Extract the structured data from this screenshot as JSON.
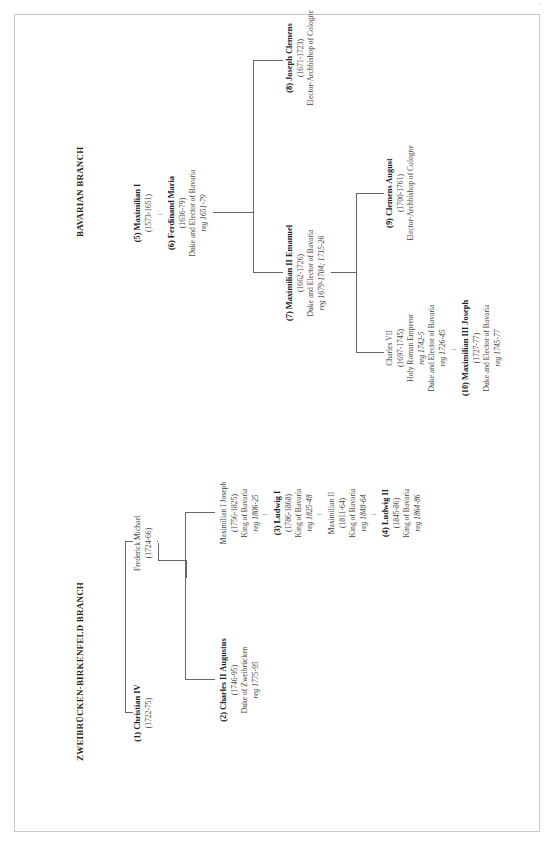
{
  "zweibrucken": {
    "title": "ZWEIBRÜCKEN-BIRKENFELD BRANCH",
    "christian_iv": {
      "name": "(1) Christian IV",
      "dates": "(1722-75)"
    },
    "frederick_michael": {
      "name": "Frederick Michael",
      "dates": "(1724-66)"
    },
    "charles_ii_augustus": {
      "name": "(2) Charles II Augustus",
      "dates": "(1746-95)",
      "title": "Duke of Zweibrücken",
      "reign": "reg 1775-95"
    },
    "maximilian_i_joseph": {
      "name": "Maximilian I Joseph",
      "dates": "(1756-1825)",
      "title": "King of Bavaria",
      "reign": "reg 1806-25"
    },
    "ludwig_i": {
      "name": "(3) Ludwig I",
      "dates": "(1786-1868)",
      "title": "King of Bavaria",
      "reign": "reg 1825-48"
    },
    "maximilian_ii": {
      "name": "Maximilian II",
      "dates": "(1811-64)",
      "title": "King of Bavaria",
      "reign": "reg 1848-64"
    },
    "ludwig_ii": {
      "name": "(4) Ludwig II",
      "dates": "(1845-86)",
      "title": "King of Bavaria",
      "reign": "reg 1864-86"
    }
  },
  "bavarian": {
    "title": "BAVARIAN BRANCH",
    "maximilian_i": {
      "name": "(5) Maximilian I",
      "dates": "(1573-1651)"
    },
    "ferdinand_maria": {
      "name": "(6) Ferdinand Maria",
      "dates": "(1636-79)",
      "title": "Duke and Elector of Bavaria",
      "reign": "reg 1651-79"
    },
    "maximilian_ii_emanuel": {
      "name": "(7) Maximilian II Emanuel",
      "dates": "(1662-1726)",
      "title": "Duke and Elector of Bavaria",
      "reign": "reg 1679-1704; 1715-26"
    },
    "joseph_clemens": {
      "name": "(8) Joseph Clemens",
      "dates": "(1671-1723)",
      "title": "Elector-Archbishop of Cologne"
    },
    "clemens_august": {
      "name": "(9) Clemens August",
      "dates": "(1700-1761)",
      "title": "Elector-Archbishop of Cologne"
    },
    "charles_vii": {
      "name": "Charles VII",
      "dates": "(1697-1745)",
      "title": "Holy Roman Emperor",
      "reign": "reg 1742-5",
      "title2": "Duke and Elector of Bavaria",
      "reign2": "reg 1726-45"
    },
    "maximilian_iii_joseph": {
      "name": "(10) Maximilian III Joseph",
      "dates": "(1727-77)",
      "title": "Duke and Elector of Bavaria",
      "reign": "reg 1745-77"
    }
  },
  "connector": "|"
}
